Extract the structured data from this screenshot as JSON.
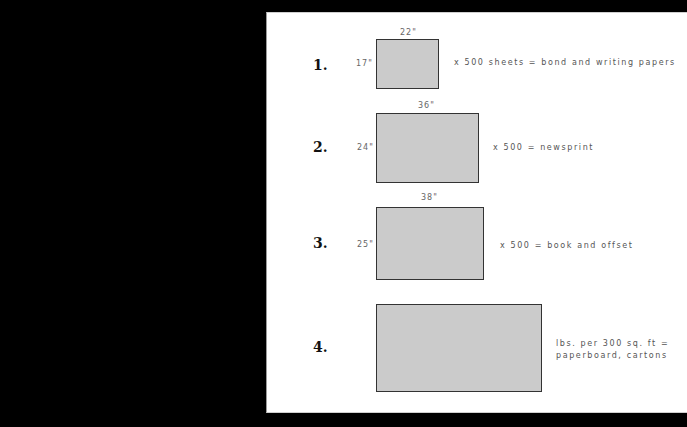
{
  "rows": [
    {
      "number": "1.",
      "width_label": "22\"",
      "height_label": "17\"",
      "description": "x 500 sheets = bond and writing papers"
    },
    {
      "number": "2.",
      "width_label": "36\"",
      "height_label": "24\"",
      "description": "x 500 = newsprint"
    },
    {
      "number": "3.",
      "width_label": "38\"",
      "height_label": "25\"",
      "description": "x 500 = book and offset"
    },
    {
      "number": "4.",
      "width_label": "",
      "height_label": "",
      "description_line1": "lbs. per 300 sq. ft =",
      "description_line2": "paperboard, cartons"
    }
  ],
  "colors": {
    "background": "#000000",
    "panel": "#ffffff",
    "sheet_fill": "#cbcbcb",
    "sheet_border": "#333333"
  }
}
